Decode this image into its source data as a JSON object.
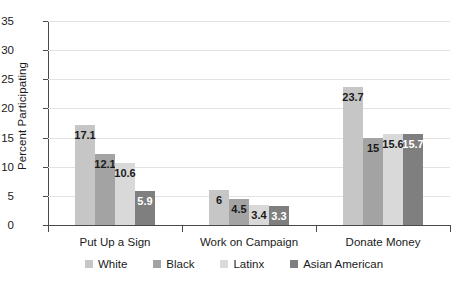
{
  "chart_data": {
    "type": "bar",
    "title": "",
    "subtitle": "",
    "xlabel": "",
    "ylabel": "Percent Participating",
    "categories": [
      "Put Up a Sign",
      "Work on Campaign",
      "Donate Money"
    ],
    "series": [
      {
        "name": "White",
        "color": "#c6c6c6",
        "label_color": "#1a1a1a",
        "values": [
          17.1,
          6,
          23.7
        ]
      },
      {
        "name": "Black",
        "color": "#a3a3a3",
        "label_color": "#1a1a1a",
        "values": [
          12.1,
          4.5,
          15
        ]
      },
      {
        "name": "Latinx",
        "color": "#d9d9d9",
        "label_color": "#1a1a1a",
        "values": [
          10.6,
          3.4,
          15.6
        ]
      },
      {
        "name": "Asian American",
        "color": "#7f7f7f",
        "label_color": "#ffffff",
        "values": [
          5.9,
          3.3,
          15.7
        ]
      }
    ],
    "value_labels": [
      [
        "17.1",
        "12.1",
        "10.6",
        "5.9"
      ],
      [
        "6",
        "4.5",
        "3.4",
        "3.3"
      ],
      [
        "23.7",
        "15",
        "15.6",
        "15.7"
      ]
    ],
    "ylim": [
      0,
      35
    ],
    "ytick_step": 5,
    "ytick_labels": [
      "0",
      "5",
      "10",
      "15",
      "20",
      "25",
      "30",
      "35"
    ],
    "grid": true,
    "grid_color": "#e2e2e2",
    "axis_color": "#4a4a4a",
    "legend_position": "bottom",
    "background": "#ffffff"
  }
}
